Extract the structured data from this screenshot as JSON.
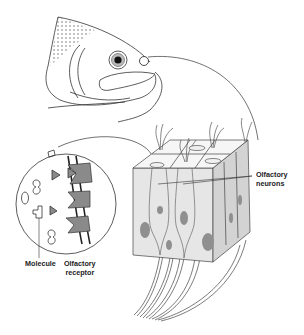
{
  "diagram": {
    "labels": {
      "olfactory_neurons": "Olfactory\nneurons",
      "molecule": "Molecule",
      "olfactory_receptor": "Olfactory\nreceptor"
    },
    "colors": {
      "line": "#333333",
      "tissue_fill": "#e6e6e6",
      "tissue_side": "#d0d0d0",
      "nucleus": "#8f8f8f",
      "receptor": "#8a8a8a",
      "background": "#ffffff"
    }
  }
}
